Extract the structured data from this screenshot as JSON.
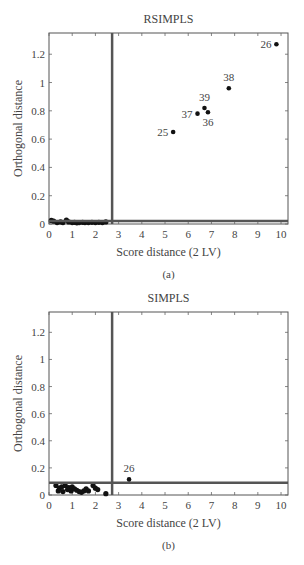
{
  "chart_data": [
    {
      "type": "scatter",
      "panel_label": "(a)",
      "title": "RSIMPLS",
      "xlabel": "Score distance (2 LV)",
      "ylabel": "Orthogonal distance",
      "xlim": [
        0,
        10.3
      ],
      "ylim": [
        0,
        1.35
      ],
      "xticks": [
        0,
        1,
        2,
        3,
        4,
        5,
        6,
        7,
        8,
        9,
        10
      ],
      "yticks": [
        0,
        0.2,
        0.4,
        0.6,
        0.8,
        1,
        1.2
      ],
      "ytick_labels": [
        "0",
        "0.2",
        "0.4",
        "0.6",
        "0.8",
        "1",
        "1.2"
      ],
      "grid": false,
      "cutoff_lines": {
        "score_distance": 2.72,
        "orthogonal_distance": 0.022
      },
      "labeled_points": [
        {
          "label": "26",
          "x": 9.8,
          "y": 1.27,
          "label_pos": "left"
        },
        {
          "label": "38",
          "x": 7.75,
          "y": 0.96,
          "label_pos": "top"
        },
        {
          "label": "39",
          "x": 6.7,
          "y": 0.82,
          "label_pos": "top"
        },
        {
          "label": "36",
          "x": 6.85,
          "y": 0.79,
          "label_pos": "bottom"
        },
        {
          "label": "37",
          "x": 6.4,
          "y": 0.78,
          "label_pos": "left"
        },
        {
          "label": "25",
          "x": 5.35,
          "y": 0.65,
          "label_pos": "left"
        }
      ],
      "points": [
        {
          "x": 0.1,
          "y": 0.025
        },
        {
          "x": 0.2,
          "y": 0.02
        },
        {
          "x": 0.35,
          "y": 0.01
        },
        {
          "x": 0.5,
          "y": 0.015
        },
        {
          "x": 0.6,
          "y": 0.01
        },
        {
          "x": 0.75,
          "y": 0.028
        },
        {
          "x": 0.85,
          "y": 0.015
        },
        {
          "x": 1.0,
          "y": 0.01
        },
        {
          "x": 1.1,
          "y": 0.012
        },
        {
          "x": 1.2,
          "y": 0.008
        },
        {
          "x": 1.3,
          "y": 0.01
        },
        {
          "x": 1.45,
          "y": 0.012
        },
        {
          "x": 1.55,
          "y": 0.01
        },
        {
          "x": 1.7,
          "y": 0.01
        },
        {
          "x": 1.85,
          "y": 0.012
        },
        {
          "x": 2.0,
          "y": 0.01
        },
        {
          "x": 2.15,
          "y": 0.012
        },
        {
          "x": 2.3,
          "y": 0.01
        },
        {
          "x": 2.45,
          "y": 0.015
        }
      ]
    },
    {
      "type": "scatter",
      "panel_label": "(b)",
      "title": "SIMPLS",
      "xlabel": "Score distance (2 LV)",
      "ylabel": "Orthogonal distance",
      "xlim": [
        0,
        10.3
      ],
      "ylim": [
        0,
        1.35
      ],
      "xticks": [
        0,
        1,
        2,
        3,
        4,
        5,
        6,
        7,
        8,
        9,
        10
      ],
      "yticks": [
        0,
        0.2,
        0.4,
        0.6,
        0.8,
        1,
        1.2
      ],
      "ytick_labels": [
        "0",
        "0.2",
        "0.4",
        "0.6",
        "0.8",
        "1",
        "1.2"
      ],
      "grid": false,
      "cutoff_lines": {
        "score_distance": 2.72,
        "orthogonal_distance": 0.09
      },
      "labeled_points": [
        {
          "label": "26",
          "x": 3.45,
          "y": 0.115,
          "label_pos": "top"
        }
      ],
      "points": [
        {
          "x": 0.3,
          "y": 0.07
        },
        {
          "x": 0.4,
          "y": 0.03
        },
        {
          "x": 0.45,
          "y": 0.05
        },
        {
          "x": 0.55,
          "y": 0.06
        },
        {
          "x": 0.6,
          "y": 0.025
        },
        {
          "x": 0.7,
          "y": 0.07
        },
        {
          "x": 0.8,
          "y": 0.04
        },
        {
          "x": 0.85,
          "y": 0.055
        },
        {
          "x": 0.95,
          "y": 0.03
        },
        {
          "x": 1.0,
          "y": 0.06
        },
        {
          "x": 1.1,
          "y": 0.045
        },
        {
          "x": 1.2,
          "y": 0.035
        },
        {
          "x": 1.3,
          "y": 0.025
        },
        {
          "x": 1.4,
          "y": 0.02
        },
        {
          "x": 1.5,
          "y": 0.03
        },
        {
          "x": 1.6,
          "y": 0.045
        },
        {
          "x": 1.7,
          "y": 0.03
        },
        {
          "x": 1.9,
          "y": 0.07
        },
        {
          "x": 2.0,
          "y": 0.05
        },
        {
          "x": 2.1,
          "y": 0.04
        },
        {
          "x": 2.45,
          "y": 0.01
        }
      ]
    }
  ]
}
